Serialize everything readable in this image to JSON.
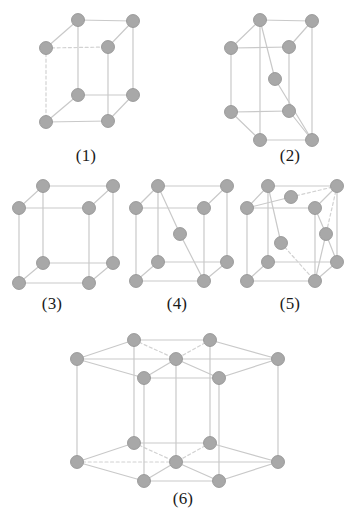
{
  "figure": {
    "background_color": "#ffffff",
    "atom_color": "#a8a8a8",
    "atom_stroke_color": "#8f8f8f",
    "edge_color": "#c9c9c9",
    "dashed_edge_color": "#d2d2d2",
    "caption_color": "#1a1a1a",
    "atom_radius": 6.5,
    "edge_width": 1.2
  },
  "cells": [
    {
      "id": "cell-1",
      "label": "(1)",
      "lattice_type": "simple tetragonal",
      "atom_count": 8,
      "caption_x": 86,
      "caption_y": 146,
      "atoms": [
        {
          "name": "corner-top-back-left",
          "x": 46,
          "y": 48,
          "hidden": false
        },
        {
          "name": "corner-top-back-right",
          "x": 108,
          "y": 47,
          "hidden": false
        },
        {
          "name": "corner-top-front-left",
          "x": 78,
          "y": 20,
          "hidden": false
        },
        {
          "name": "corner-top-front-right",
          "x": 133,
          "y": 21,
          "hidden": false
        },
        {
          "name": "corner-bottom-back-left",
          "x": 46,
          "y": 122,
          "hidden": false
        },
        {
          "name": "corner-bottom-back-right",
          "x": 108,
          "y": 121,
          "hidden": false
        },
        {
          "name": "corner-bottom-front-left",
          "x": 78,
          "y": 95,
          "hidden": false
        },
        {
          "name": "corner-bottom-front-right",
          "x": 133,
          "y": 95,
          "hidden": false
        }
      ],
      "edges": [
        {
          "from": 2,
          "to": 3,
          "dashed": false
        },
        {
          "from": 0,
          "to": 2,
          "dashed": false
        },
        {
          "from": 1,
          "to": 3,
          "dashed": false
        },
        {
          "from": 0,
          "to": 1,
          "dashed": true
        },
        {
          "from": 6,
          "to": 7,
          "dashed": false
        },
        {
          "from": 4,
          "to": 6,
          "dashed": false
        },
        {
          "from": 5,
          "to": 7,
          "dashed": false
        },
        {
          "from": 4,
          "to": 5,
          "dashed": false
        },
        {
          "from": 2,
          "to": 6,
          "dashed": false
        },
        {
          "from": 3,
          "to": 7,
          "dashed": false
        },
        {
          "from": 0,
          "to": 4,
          "dashed": true
        },
        {
          "from": 1,
          "to": 5,
          "dashed": false
        }
      ]
    },
    {
      "id": "cell-2",
      "label": "(2)",
      "lattice_type": "body-centred tetragonal",
      "atom_count": 9,
      "caption_x": 290,
      "caption_y": 146,
      "atoms": [
        {
          "name": "corner-top-back-left",
          "x": 231,
          "y": 48,
          "hidden": false
        },
        {
          "name": "corner-top-back-right",
          "x": 289,
          "y": 47,
          "hidden": false
        },
        {
          "name": "corner-top-front-left",
          "x": 260,
          "y": 20,
          "hidden": false
        },
        {
          "name": "corner-top-front-right",
          "x": 312,
          "y": 21,
          "hidden": false
        },
        {
          "name": "corner-bottom-back-left",
          "x": 231,
          "y": 112,
          "hidden": false
        },
        {
          "name": "corner-bottom-back-right",
          "x": 289,
          "y": 111,
          "hidden": false
        },
        {
          "name": "corner-bottom-front-left",
          "x": 260,
          "y": 140,
          "hidden": false
        },
        {
          "name": "corner-bottom-front-right",
          "x": 312,
          "y": 140,
          "hidden": false
        },
        {
          "name": "body-centre",
          "x": 275,
          "y": 79,
          "hidden": false
        }
      ],
      "edges": [
        {
          "from": 2,
          "to": 3,
          "dashed": false
        },
        {
          "from": 0,
          "to": 2,
          "dashed": false
        },
        {
          "from": 1,
          "to": 3,
          "dashed": false
        },
        {
          "from": 0,
          "to": 1,
          "dashed": false
        },
        {
          "from": 6,
          "to": 7,
          "dashed": false
        },
        {
          "from": 4,
          "to": 6,
          "dashed": false
        },
        {
          "from": 5,
          "to": 7,
          "dashed": false
        },
        {
          "from": 4,
          "to": 5,
          "dashed": false
        },
        {
          "from": 2,
          "to": 6,
          "dashed": false
        },
        {
          "from": 3,
          "to": 7,
          "dashed": false
        },
        {
          "from": 0,
          "to": 4,
          "dashed": false
        },
        {
          "from": 1,
          "to": 5,
          "dashed": false
        },
        {
          "from": 2,
          "to": 8,
          "dashed": false
        },
        {
          "from": 8,
          "to": 7,
          "dashed": false
        }
      ]
    },
    {
      "id": "cell-3",
      "label": "(3)",
      "lattice_type": "simple cubic",
      "atom_count": 8,
      "caption_x": 52,
      "caption_y": 294,
      "atoms": [
        {
          "name": "corner-top-back-left",
          "x": 19,
          "y": 208,
          "hidden": false
        },
        {
          "name": "corner-top-back-right",
          "x": 89,
          "y": 208,
          "hidden": false
        },
        {
          "name": "corner-top-front-left",
          "x": 43,
          "y": 186,
          "hidden": false
        },
        {
          "name": "corner-top-front-right",
          "x": 113,
          "y": 186,
          "hidden": false
        },
        {
          "name": "corner-bottom-back-left",
          "x": 19,
          "y": 283,
          "hidden": false
        },
        {
          "name": "corner-bottom-back-right",
          "x": 89,
          "y": 283,
          "hidden": false
        },
        {
          "name": "corner-bottom-front-left",
          "x": 43,
          "y": 263,
          "hidden": false
        },
        {
          "name": "corner-bottom-front-right",
          "x": 113,
          "y": 263,
          "hidden": false
        }
      ],
      "edges": [
        {
          "from": 2,
          "to": 3,
          "dashed": false
        },
        {
          "from": 0,
          "to": 2,
          "dashed": false
        },
        {
          "from": 1,
          "to": 3,
          "dashed": false
        },
        {
          "from": 0,
          "to": 1,
          "dashed": false
        },
        {
          "from": 6,
          "to": 7,
          "dashed": false
        },
        {
          "from": 4,
          "to": 6,
          "dashed": false
        },
        {
          "from": 5,
          "to": 7,
          "dashed": false
        },
        {
          "from": 4,
          "to": 5,
          "dashed": false
        },
        {
          "from": 2,
          "to": 6,
          "dashed": false
        },
        {
          "from": 3,
          "to": 7,
          "dashed": false
        },
        {
          "from": 0,
          "to": 4,
          "dashed": false
        },
        {
          "from": 1,
          "to": 5,
          "dashed": false
        }
      ]
    },
    {
      "id": "cell-4",
      "label": "(4)",
      "lattice_type": "body-centred cubic",
      "atom_count": 9,
      "caption_x": 177,
      "caption_y": 294,
      "atoms": [
        {
          "name": "corner-top-back-left",
          "x": 136,
          "y": 208,
          "hidden": false
        },
        {
          "name": "corner-top-back-right",
          "x": 204,
          "y": 208,
          "hidden": false
        },
        {
          "name": "corner-top-front-left",
          "x": 158,
          "y": 186,
          "hidden": false
        },
        {
          "name": "corner-top-front-right",
          "x": 227,
          "y": 186,
          "hidden": false
        },
        {
          "name": "corner-bottom-back-left",
          "x": 136,
          "y": 281,
          "hidden": false
        },
        {
          "name": "corner-bottom-back-right",
          "x": 204,
          "y": 281,
          "hidden": false
        },
        {
          "name": "corner-bottom-front-left",
          "x": 158,
          "y": 262,
          "hidden": false
        },
        {
          "name": "corner-bottom-front-right",
          "x": 227,
          "y": 262,
          "hidden": false
        },
        {
          "name": "body-centre",
          "x": 180,
          "y": 234,
          "hidden": false
        }
      ],
      "edges": [
        {
          "from": 2,
          "to": 3,
          "dashed": false
        },
        {
          "from": 0,
          "to": 2,
          "dashed": false
        },
        {
          "from": 1,
          "to": 3,
          "dashed": false
        },
        {
          "from": 0,
          "to": 1,
          "dashed": false
        },
        {
          "from": 6,
          "to": 7,
          "dashed": false
        },
        {
          "from": 4,
          "to": 6,
          "dashed": false
        },
        {
          "from": 5,
          "to": 7,
          "dashed": false
        },
        {
          "from": 4,
          "to": 5,
          "dashed": false
        },
        {
          "from": 2,
          "to": 6,
          "dashed": false
        },
        {
          "from": 3,
          "to": 7,
          "dashed": false
        },
        {
          "from": 0,
          "to": 4,
          "dashed": false
        },
        {
          "from": 1,
          "to": 5,
          "dashed": false
        },
        {
          "from": 2,
          "to": 8,
          "dashed": false
        },
        {
          "from": 8,
          "to": 5,
          "dashed": false
        }
      ]
    },
    {
      "id": "cell-5",
      "label": "(5)",
      "lattice_type": "face-centred cubic",
      "atom_count": 14,
      "caption_x": 290,
      "caption_y": 294,
      "atoms": [
        {
          "name": "corner-top-back-left",
          "x": 247,
          "y": 208,
          "hidden": false
        },
        {
          "name": "corner-top-back-right",
          "x": 315,
          "y": 208,
          "hidden": false
        },
        {
          "name": "corner-top-front-left",
          "x": 268,
          "y": 186,
          "hidden": false
        },
        {
          "name": "corner-top-front-right",
          "x": 337,
          "y": 186,
          "hidden": false
        },
        {
          "name": "corner-bottom-back-left",
          "x": 247,
          "y": 281,
          "hidden": false
        },
        {
          "name": "corner-bottom-back-right",
          "x": 315,
          "y": 281,
          "hidden": false
        },
        {
          "name": "corner-bottom-front-left",
          "x": 268,
          "y": 262,
          "hidden": false
        },
        {
          "name": "corner-bottom-front-right",
          "x": 337,
          "y": 262,
          "hidden": false
        },
        {
          "name": "face-centre-top",
          "x": 291,
          "y": 197,
          "hidden": false
        },
        {
          "name": "face-centre-front",
          "x": 281,
          "y": 243,
          "hidden": false
        },
        {
          "name": "face-centre-right",
          "x": 326,
          "y": 234,
          "hidden": false
        }
      ],
      "edges": [
        {
          "from": 2,
          "to": 3,
          "dashed": false
        },
        {
          "from": 0,
          "to": 2,
          "dashed": false
        },
        {
          "from": 1,
          "to": 3,
          "dashed": false
        },
        {
          "from": 0,
          "to": 1,
          "dashed": false
        },
        {
          "from": 6,
          "to": 7,
          "dashed": false
        },
        {
          "from": 4,
          "to": 6,
          "dashed": false
        },
        {
          "from": 5,
          "to": 7,
          "dashed": false
        },
        {
          "from": 4,
          "to": 5,
          "dashed": false
        },
        {
          "from": 2,
          "to": 6,
          "dashed": false
        },
        {
          "from": 3,
          "to": 7,
          "dashed": false
        },
        {
          "from": 0,
          "to": 4,
          "dashed": false
        },
        {
          "from": 1,
          "to": 5,
          "dashed": false
        },
        {
          "from": 0,
          "to": 8,
          "dashed": false
        },
        {
          "from": 8,
          "to": 3,
          "dashed": true
        },
        {
          "from": 2,
          "to": 9,
          "dashed": false
        },
        {
          "from": 9,
          "to": 5,
          "dashed": true
        },
        {
          "from": 1,
          "to": 10,
          "dashed": false
        },
        {
          "from": 10,
          "to": 5,
          "dashed": false
        },
        {
          "from": 3,
          "to": 10,
          "dashed": true
        },
        {
          "from": 10,
          "to": 7,
          "dashed": false
        }
      ]
    },
    {
      "id": "cell-6",
      "label": "(6)",
      "lattice_type": "hexagonal close packed",
      "atom_count": 17,
      "caption_x": 183,
      "caption_y": 489,
      "atoms": [
        {
          "name": "top-hex-left",
          "x": 77,
          "y": 359,
          "hidden": false
        },
        {
          "name": "top-hex-back-left",
          "x": 134,
          "y": 340,
          "hidden": false
        },
        {
          "name": "top-hex-back-right",
          "x": 210,
          "y": 340,
          "hidden": false
        },
        {
          "name": "top-hex-right",
          "x": 278,
          "y": 359,
          "hidden": false
        },
        {
          "name": "top-hex-front-right",
          "x": 219,
          "y": 378,
          "hidden": false
        },
        {
          "name": "top-hex-front-left",
          "x": 144,
          "y": 378,
          "hidden": false
        },
        {
          "name": "top-hex-centre",
          "x": 176,
          "y": 359,
          "hidden": false
        },
        {
          "name": "bottom-hex-left",
          "x": 77,
          "y": 462,
          "hidden": false
        },
        {
          "name": "bottom-hex-back-left",
          "x": 134,
          "y": 443,
          "hidden": false
        },
        {
          "name": "bottom-hex-back-right",
          "x": 210,
          "y": 443,
          "hidden": false
        },
        {
          "name": "bottom-hex-right",
          "x": 278,
          "y": 462,
          "hidden": false
        },
        {
          "name": "bottom-hex-front-right",
          "x": 219,
          "y": 481,
          "hidden": false
        },
        {
          "name": "bottom-hex-front-left",
          "x": 144,
          "y": 481,
          "hidden": false
        },
        {
          "name": "bottom-hex-centre",
          "x": 176,
          "y": 462,
          "hidden": false
        },
        {
          "name": "interior-mid-left",
          "x": 146,
          "y": 411,
          "hidden": true
        },
        {
          "name": "interior-mid-right",
          "x": 215,
          "y": 411,
          "hidden": true
        },
        {
          "name": "interior-mid-centre",
          "x": 181,
          "y": 400,
          "hidden": true
        }
      ],
      "edges": [
        {
          "from": 0,
          "to": 1,
          "dashed": false
        },
        {
          "from": 1,
          "to": 2,
          "dashed": false
        },
        {
          "from": 2,
          "to": 3,
          "dashed": false
        },
        {
          "from": 3,
          "to": 4,
          "dashed": false
        },
        {
          "from": 4,
          "to": 5,
          "dashed": false
        },
        {
          "from": 5,
          "to": 0,
          "dashed": false
        },
        {
          "from": 0,
          "to": 6,
          "dashed": false
        },
        {
          "from": 6,
          "to": 3,
          "dashed": false
        },
        {
          "from": 1,
          "to": 6,
          "dashed": true
        },
        {
          "from": 2,
          "to": 6,
          "dashed": true
        },
        {
          "from": 4,
          "to": 6,
          "dashed": false
        },
        {
          "from": 5,
          "to": 6,
          "dashed": false
        },
        {
          "from": 7,
          "to": 8,
          "dashed": false
        },
        {
          "from": 8,
          "to": 9,
          "dashed": false
        },
        {
          "from": 9,
          "to": 10,
          "dashed": false
        },
        {
          "from": 10,
          "to": 11,
          "dashed": false
        },
        {
          "from": 11,
          "to": 12,
          "dashed": false
        },
        {
          "from": 12,
          "to": 7,
          "dashed": false
        },
        {
          "from": 7,
          "to": 13,
          "dashed": true
        },
        {
          "from": 13,
          "to": 10,
          "dashed": false
        },
        {
          "from": 8,
          "to": 13,
          "dashed": true
        },
        {
          "from": 9,
          "to": 13,
          "dashed": true
        },
        {
          "from": 11,
          "to": 13,
          "dashed": false
        },
        {
          "from": 12,
          "to": 13,
          "dashed": false
        },
        {
          "from": 0,
          "to": 7,
          "dashed": false
        },
        {
          "from": 1,
          "to": 8,
          "dashed": false
        },
        {
          "from": 2,
          "to": 9,
          "dashed": false
        },
        {
          "from": 3,
          "to": 10,
          "dashed": false
        },
        {
          "from": 4,
          "to": 11,
          "dashed": false
        },
        {
          "from": 5,
          "to": 12,
          "dashed": false
        },
        {
          "from": 6,
          "to": 13,
          "dashed": false
        }
      ]
    }
  ]
}
